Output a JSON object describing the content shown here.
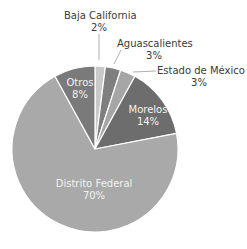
{
  "chart_data": {
    "type": "pie",
    "title": "",
    "categories": [
      "Baja California",
      "Aguascalientes",
      "Estado de México",
      "Morelos",
      "Distrito Federal",
      "Otros"
    ],
    "values": [
      2,
      3,
      3,
      14,
      70,
      8
    ],
    "value_labels": [
      "2%",
      "3%",
      "3%",
      "14%",
      "70%",
      "8%"
    ],
    "colors": [
      "#c9c9c9",
      "#7f7f7f",
      "#a6a6a6",
      "#6d6d6d",
      "#a9a9a9",
      "#7a7a7a"
    ],
    "start_angle_deg": 0,
    "direction": "clockwise",
    "legend": "none",
    "labels_outside": [
      "Baja California",
      "Aguascalientes",
      "Estado de México"
    ]
  },
  "labels": {
    "baja": {
      "name": "Baja California",
      "pct": "2%"
    },
    "ags": {
      "name": "Aguascalientes",
      "pct": "3%"
    },
    "edomex": {
      "name": "Estado de México",
      "pct": "3%"
    },
    "morelos": {
      "name": "Morelos",
      "pct": "14%"
    },
    "df": {
      "name": "Distrito Federal",
      "pct": "70%"
    },
    "otros": {
      "name": "Otros",
      "pct": "8%"
    }
  }
}
